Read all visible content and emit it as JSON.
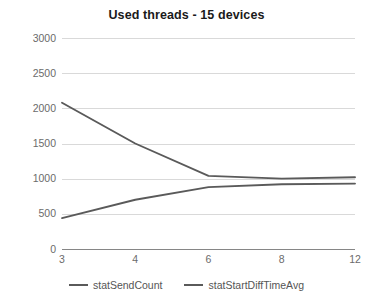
{
  "chart_data": {
    "type": "line",
    "title": "Used threads - 15 devices",
    "xlabel": "",
    "ylabel": "",
    "categories": [
      "3",
      "4",
      "6",
      "8",
      "12"
    ],
    "series": [
      {
        "name": "statSendCount",
        "values": [
          440,
          700,
          880,
          920,
          930
        ],
        "color": "#5a5a5a"
      },
      {
        "name": "statStartDiffTimeAvg",
        "values": [
          2080,
          1500,
          1040,
          1000,
          1020
        ],
        "color": "#5a5a5a"
      }
    ],
    "ylim": [
      0,
      3000
    ],
    "yticks": [
      0,
      500,
      1000,
      1500,
      2000,
      2500,
      3000
    ],
    "ytick_labels": [
      "0",
      "500",
      "1000",
      "1500",
      "2000",
      "2500",
      "3000"
    ],
    "grid": true,
    "grid_color": "#d9d9d9",
    "legend_position": "bottom",
    "axis_color": "#868686",
    "label_color": "#6b6b6b",
    "title_color": "#1a1a1a"
  },
  "legend": {
    "entries": [
      {
        "label": "statSendCount"
      },
      {
        "label": "statStartDiffTimeAvg"
      }
    ]
  }
}
